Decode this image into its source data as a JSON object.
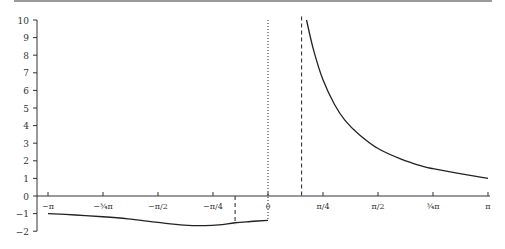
{
  "chart_data": {
    "type": "line",
    "title": "",
    "xlabel": "",
    "ylabel": "",
    "xlim": [
      -3.14159,
      3.14159
    ],
    "ylim": [
      -2,
      10
    ],
    "grid": false,
    "legend": null,
    "x_ticks": [
      {
        "value": -3.14159,
        "label": "−π"
      },
      {
        "value": -2.35619,
        "label": "−¾π"
      },
      {
        "value": -1.5708,
        "label": "−π/2"
      },
      {
        "value": -0.7854,
        "label": "−π/4"
      },
      {
        "value": 0,
        "label": "0"
      },
      {
        "value": 0.7854,
        "label": "π/4"
      },
      {
        "value": 1.5708,
        "label": "π/2"
      },
      {
        "value": 2.35619,
        "label": "¾π"
      },
      {
        "value": 3.14159,
        "label": "π"
      }
    ],
    "y_ticks": [
      -2,
      -1,
      0,
      1,
      2,
      3,
      4,
      5,
      6,
      7,
      8,
      9,
      10
    ],
    "vertical_lines": [
      {
        "x": -0.47,
        "style": "dashed",
        "ymin": -1.6,
        "ymax": 0
      },
      {
        "x": 0,
        "style": "dotted",
        "ymin": -1.4,
        "ymax": 10
      },
      {
        "x": 0.48,
        "style": "dashed",
        "ymin": 0,
        "ymax": 10.2
      }
    ],
    "series": [
      {
        "name": "left branch",
        "x": [
          -3.14159,
          -2.75,
          -2.35619,
          -2.0,
          -1.5708,
          -1.2,
          -0.9,
          -0.7,
          -0.47,
          -0.25,
          0
        ],
        "y": [
          -1.0,
          -1.08,
          -1.18,
          -1.3,
          -1.5,
          -1.65,
          -1.68,
          -1.64,
          -1.52,
          -1.45,
          -1.38
        ]
      },
      {
        "name": "right branch",
        "x": [
          0.55,
          0.65,
          0.785,
          0.95,
          1.1,
          1.3,
          1.5708,
          1.9,
          2.2,
          2.35619,
          2.7,
          3.14159
        ],
        "y": [
          10.0,
          8.3,
          6.6,
          5.2,
          4.3,
          3.5,
          2.7,
          2.1,
          1.7,
          1.55,
          1.3,
          1.0
        ]
      }
    ]
  }
}
